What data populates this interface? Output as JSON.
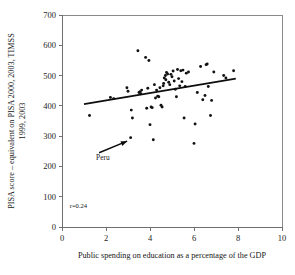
{
  "chart_data": {
    "type": "scatter",
    "title": "",
    "xlabel": "Public spending on education as a percentage of the GDP",
    "ylabel": "PISA score – equivalent on PISA 2000, 2003, TIMSS 1999, 2003",
    "xlim": [
      0,
      10
    ],
    "ylim": [
      0,
      700
    ],
    "xticks": [
      0,
      2,
      4,
      6,
      8,
      10
    ],
    "yticks": [
      0,
      100,
      200,
      300,
      400,
      500,
      600,
      700
    ],
    "xtick_labels": [
      "0",
      "2",
      "4",
      "6",
      "8",
      "10"
    ],
    "ytick_labels": [
      "0",
      "100",
      "200",
      "300",
      "400",
      "500",
      "600",
      "700"
    ],
    "grid": false,
    "legend": null,
    "annotations": [
      {
        "name": "correlation",
        "text": "r=0.24",
        "x": 0.35,
        "y": 62
      },
      {
        "name": "peru-label",
        "text": "Peru",
        "x": 1.55,
        "y": 222,
        "points_to_x": 3.12,
        "points_to_y": 295
      }
    ],
    "series": [
      {
        "name": "countries",
        "marker": "filled-circle",
        "color": "#121212",
        "points": [
          [
            1.25,
            368
          ],
          [
            2.2,
            428
          ],
          [
            2.35,
            424
          ],
          [
            2.95,
            460
          ],
          [
            3.0,
            448
          ],
          [
            3.12,
            295
          ],
          [
            3.15,
            386
          ],
          [
            3.2,
            360
          ],
          [
            3.45,
            582
          ],
          [
            3.5,
            444
          ],
          [
            3.55,
            447
          ],
          [
            3.58,
            440
          ],
          [
            3.62,
            452
          ],
          [
            3.8,
            560
          ],
          [
            3.85,
            392
          ],
          [
            3.9,
            458
          ],
          [
            3.95,
            550
          ],
          [
            4.0,
            338
          ],
          [
            4.05,
            396
          ],
          [
            4.1,
            394
          ],
          [
            4.15,
            288
          ],
          [
            4.2,
            470
          ],
          [
            4.25,
            426
          ],
          [
            4.3,
            452
          ],
          [
            4.35,
            432
          ],
          [
            4.4,
            430
          ],
          [
            4.45,
            460
          ],
          [
            4.5,
            402
          ],
          [
            4.55,
            396
          ],
          [
            4.6,
            466
          ],
          [
            4.62,
            474
          ],
          [
            4.65,
            492
          ],
          [
            4.7,
            500
          ],
          [
            4.72,
            486
          ],
          [
            4.75,
            510
          ],
          [
            4.8,
            505
          ],
          [
            4.85,
            478
          ],
          [
            4.9,
            470
          ],
          [
            4.95,
            504
          ],
          [
            5.0,
            496
          ],
          [
            5.05,
            515
          ],
          [
            5.1,
            482
          ],
          [
            5.15,
            455
          ],
          [
            5.2,
            430
          ],
          [
            5.25,
            520
          ],
          [
            5.3,
            490
          ],
          [
            5.35,
            466
          ],
          [
            5.4,
            516
          ],
          [
            5.45,
            480
          ],
          [
            5.5,
            518
          ],
          [
            5.55,
            360
          ],
          [
            5.6,
            464
          ],
          [
            5.65,
            508
          ],
          [
            5.75,
            512
          ],
          [
            6.0,
            276
          ],
          [
            6.05,
            340
          ],
          [
            6.15,
            444
          ],
          [
            6.3,
            530
          ],
          [
            6.4,
            420
          ],
          [
            6.5,
            434
          ],
          [
            6.55,
            536
          ],
          [
            6.6,
            538
          ],
          [
            6.65,
            464
          ],
          [
            6.75,
            368
          ],
          [
            6.8,
            418
          ],
          [
            6.9,
            512
          ],
          [
            7.35,
            500
          ],
          [
            7.45,
            492
          ],
          [
            7.8,
            516
          ]
        ]
      }
    ],
    "trendline": {
      "name": "linear-fit",
      "x_start": 1.0,
      "y_start": 406,
      "x_end": 7.9,
      "y_end": 490,
      "color": "#0d0d0d"
    }
  }
}
